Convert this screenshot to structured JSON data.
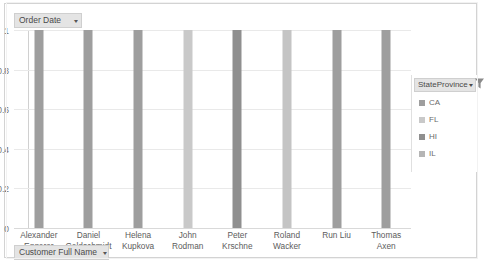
{
  "chart_data": {
    "type": "bar",
    "title": "",
    "xlabel": "Customer Full Name",
    "ylabel": "",
    "categories": [
      "Alexander Eggerer",
      "Daniel Goldschmidt",
      "Helena Kupkova",
      "John Rodman",
      "Peter Krschne",
      "Roland Wacker",
      "Run Liu",
      "Thomas Axen"
    ],
    "values": [
      1,
      1,
      1,
      1,
      1,
      1,
      1,
      1
    ],
    "bar_colors": [
      "#9e9e9e",
      "#9e9e9e",
      "#9e9e9e",
      "#c9c9c9",
      "#8f8f8f",
      "#c4c4c4",
      "#9e9e9e",
      "#9e9e9e"
    ],
    "series": [
      {
        "name": "CA",
        "values": [
          1,
          1,
          1,
          0,
          0,
          0,
          0,
          0
        ]
      },
      {
        "name": "FL",
        "values": [
          0,
          0,
          0,
          1,
          0,
          0,
          0,
          0
        ]
      },
      {
        "name": "HI",
        "values": [
          0,
          0,
          0,
          0,
          1,
          0,
          0,
          0
        ]
      },
      {
        "name": "IL",
        "values": [
          0,
          0,
          0,
          0,
          0,
          1,
          1,
          1
        ]
      }
    ],
    "ylim": [
      0,
      1
    ],
    "yticks": [
      "0",
      "0.2",
      "0.4",
      "0.6",
      "0.8",
      "1"
    ],
    "ytick_values": [
      0,
      0.2,
      0.4,
      0.6,
      0.8,
      1
    ],
    "grid": true,
    "legend_position": "right",
    "legend_title": "StateProvince",
    "legend_entries": [
      {
        "label": "CA",
        "color": "#9e9e9e"
      },
      {
        "label": "FL",
        "color": "#c9c9c9"
      },
      {
        "label": "HI",
        "color": "#8f8f8f"
      },
      {
        "label": "IL",
        "color": "#b5b5b5"
      }
    ]
  },
  "pivot_chart": {
    "row_field_button": {
      "label": "Order Date",
      "arrow": "▾"
    },
    "axis_field_button": {
      "label": "Customer Full Name",
      "arrow": "▾"
    },
    "legend_field_button": {
      "label": "StateProvince",
      "arrow": "▾"
    }
  },
  "colors": {
    "frame_border": "#d3d3d3",
    "button_fill": "#e4e4e4",
    "button_border": "#cfcfcf",
    "grid_line": "#e9e9e9",
    "axis_line": "#d0d0d0",
    "text": "#595959"
  }
}
